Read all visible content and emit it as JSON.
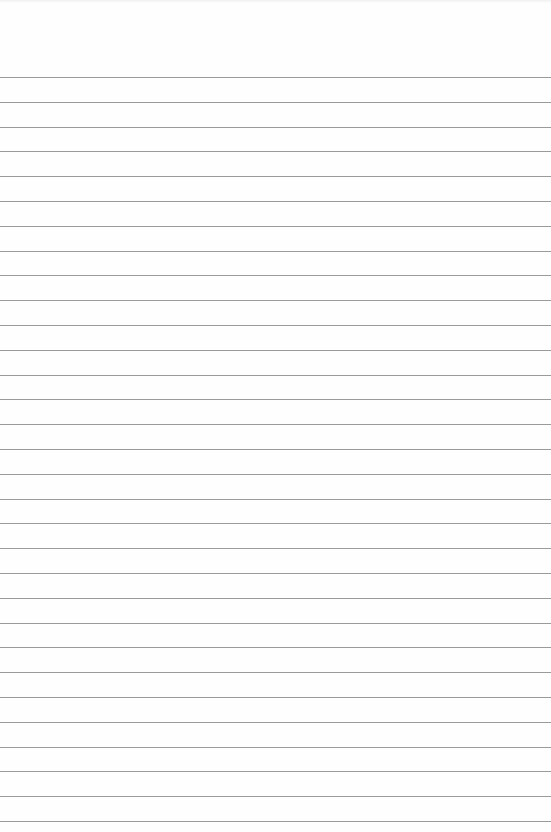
{
  "paper": {
    "type": "lined notepad page",
    "background_color": "#fefefe",
    "rule_color": "#9a9a9a",
    "first_rule_y": 77,
    "rule_spacing": 24.8,
    "rule_count": 31
  }
}
